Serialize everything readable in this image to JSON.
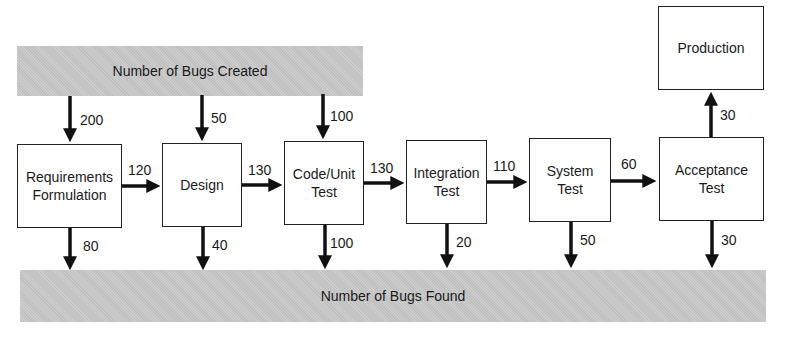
{
  "banners": {
    "created": "Number of Bugs Created",
    "found": "Number of Bugs Found"
  },
  "stages": [
    {
      "name": "Requirements Formulation",
      "line1": "Requirements",
      "line2": "Formulation",
      "created": "200",
      "found": "80",
      "passed_on": "120"
    },
    {
      "name": "Design",
      "line1": "Design",
      "line2": "",
      "created": "50",
      "found": "40",
      "passed_on": "130"
    },
    {
      "name": "Code/Unit Test",
      "line1": "Code/Unit",
      "line2": "Test",
      "created": "100",
      "found": "100",
      "passed_on": "130"
    },
    {
      "name": "Integration Test",
      "line1": "Integration",
      "line2": "Test",
      "found": "20",
      "passed_on": "110"
    },
    {
      "name": "System Test",
      "line1": "System",
      "line2": "Test",
      "found": "50",
      "passed_on": "60"
    },
    {
      "name": "Acceptance Test",
      "line1": "Acceptance",
      "line2": "Test",
      "found": "30",
      "passed_on": "30"
    }
  ],
  "production": {
    "label": "Production"
  }
}
